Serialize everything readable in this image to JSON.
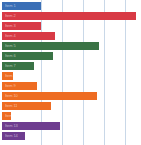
{
  "chart_data": {
    "type": "bar",
    "orientation": "horizontal",
    "title": "",
    "subtitle": "",
    "xlabel": "",
    "ylabel": "",
    "grid": true,
    "grid_axis": "x",
    "legend": false,
    "legend_position": "none",
    "xlim": [
      0,
      6.6
    ],
    "x_gridlines": [
      2,
      3,
      4,
      5,
      6
    ],
    "axis_labels_visible": false,
    "tick_labels_visible": false,
    "bar_height_px": 8,
    "bar_gap_px": 2,
    "categories": [
      "Item 1",
      "Item 2",
      "Item 3",
      "Item 4",
      "Item 5",
      "Item 6",
      "Item 7",
      "Item 8",
      "Item 9",
      "Item 10",
      "Item 11",
      "Item 12",
      "Item 13",
      "Item 14"
    ],
    "values": [
      2.0,
      6.5,
      2.0,
      2.7,
      4.8,
      2.5,
      1.6,
      0.55,
      1.75,
      4.7,
      2.4,
      0.45,
      2.85,
      1.15
    ],
    "colors": [
      "#3b6fb6",
      "#d83a45",
      "#d83a45",
      "#d83a45",
      "#3a7345",
      "#3a7345",
      "#3a7345",
      "#ee6c22",
      "#ee6c22",
      "#ee6c22",
      "#ee6c22",
      "#ee6c22",
      "#6e3d8f",
      "#6e3d8f"
    ],
    "groups": [
      {
        "name": "Blue group",
        "color": "#3b6fb6",
        "count": 1
      },
      {
        "name": "Red group",
        "color": "#d83a45",
        "count": 3
      },
      {
        "name": "Green group",
        "color": "#3a7345",
        "count": 3
      },
      {
        "name": "Orange group",
        "color": "#ee6c22",
        "count": 5
      },
      {
        "name": "Purple group",
        "color": "#6e3d8f",
        "count": 2
      }
    ],
    "bar_end_px": [
      41,
      136,
      41,
      55,
      99,
      53,
      34,
      13,
      37,
      97,
      51,
      11,
      60,
      25
    ],
    "gridline_px": [
      41,
      62,
      83,
      104,
      125
    ],
    "grid_color": "#c9d8e8",
    "background": "#ffffff"
  }
}
